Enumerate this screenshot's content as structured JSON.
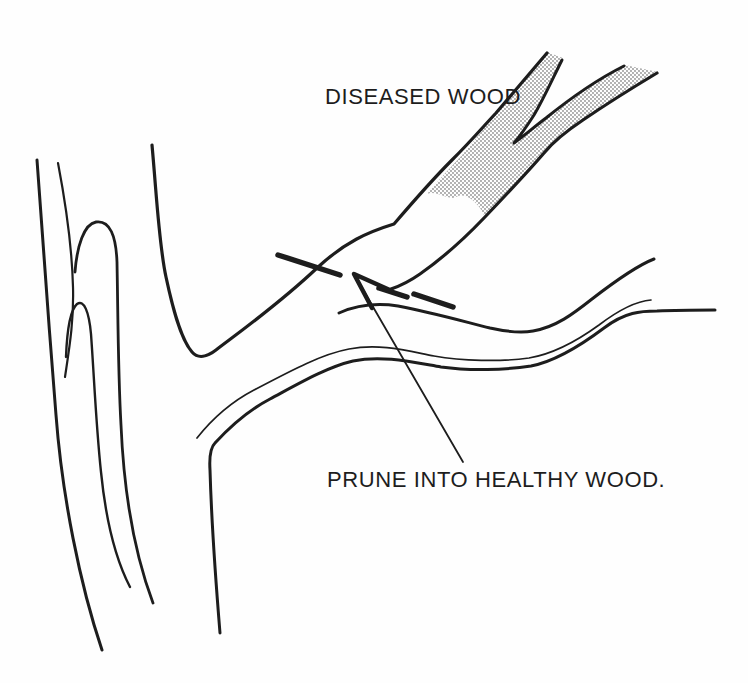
{
  "figure": {
    "type": "pruning-illustration",
    "background_color": "#fefefe",
    "ink_color": "#1d1d1d",
    "stipple_color": "#8f8f8f",
    "labels": {
      "diseased_wood": "DISEASED WOOD",
      "prune_instruction": "PRUNE INTO HEALTHY WOOD."
    }
  }
}
